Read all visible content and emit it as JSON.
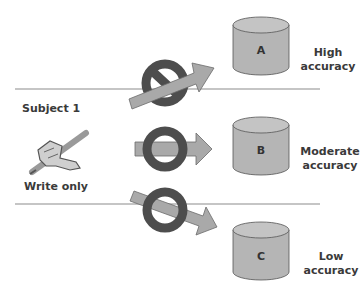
{
  "subject": {
    "label": "Subject 1",
    "access_mode": "Write only",
    "icon": "writing-hand-icon"
  },
  "levels": [
    {
      "id": "A",
      "accuracy_line1": "High",
      "accuracy_line2": "accuracy",
      "flow": "blocked",
      "arrow_direction": "up-right"
    },
    {
      "id": "B",
      "accuracy_line1": "Moderate",
      "accuracy_line2": "accuracy",
      "flow": "allowed",
      "arrow_direction": "right"
    },
    {
      "id": "C",
      "accuracy_line1": "Low",
      "accuracy_line2": "accuracy",
      "flow": "allowed",
      "arrow_direction": "down-right"
    }
  ],
  "colors": {
    "cylinder_fill": "#b5b5b5",
    "cylinder_top": "#c4c4c4",
    "cylinder_stroke": "#555555",
    "arrow_fill": "#a9a9a9",
    "arrow_stroke": "#6b6b6b",
    "ring": "#4d4d4d",
    "divider": "#8c8c8c",
    "text": "#3a3a3a"
  }
}
